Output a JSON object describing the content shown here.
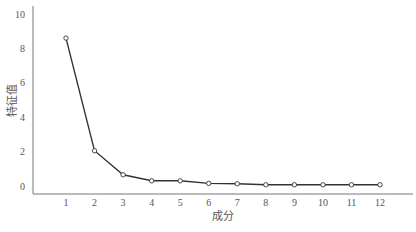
{
  "chart_data": {
    "type": "line",
    "title": "",
    "xlabel": "成分",
    "ylabel": "特征值",
    "x": [
      1,
      2,
      3,
      4,
      5,
      6,
      7,
      8,
      9,
      10,
      11,
      12
    ],
    "categories": [
      "1",
      "2",
      "3",
      "4",
      "5",
      "6",
      "7",
      "8",
      "9",
      "10",
      "11",
      "12"
    ],
    "series": [
      {
        "name": "特征值",
        "values": [
          8.6,
          2.05,
          0.65,
          0.3,
          0.3,
          0.15,
          0.13,
          0.07,
          0.07,
          0.07,
          0.07,
          0.07
        ]
      }
    ],
    "yticks": [
      0,
      2,
      4,
      6,
      8,
      10
    ],
    "ylim": [
      -0.45,
      10.4
    ],
    "xlim": [
      -0.1,
      13.3
    ],
    "grid": false,
    "legend": "none",
    "marker": "open-circle"
  }
}
